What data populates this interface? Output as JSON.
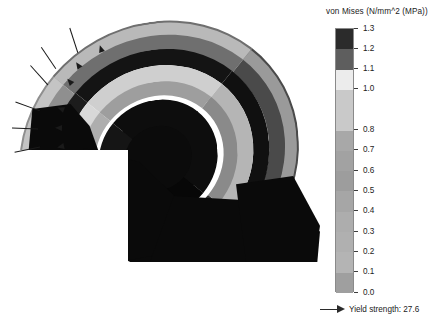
{
  "legend": {
    "title": "von Mises (N/mm^2 (MPa))",
    "units": "N/mm^2 (MPa)",
    "quantity": "von Mises",
    "yield_marker": {
      "label": "Yield strength: 27.6",
      "value": 27.6,
      "icon": "arrow-right-icon"
    }
  },
  "chart_data": {
    "type": "heatmap",
    "title": "von Mises (N/mm^2 (MPa))",
    "colorbar_orientation": "vertical",
    "colormap": "grayscale-banded",
    "legend_position": "right",
    "grid": false,
    "xlabel": "",
    "ylabel": "von Mises (N/mm^2 (MPa))",
    "ylim": [
      0.0,
      1.3
    ],
    "tick_labels": [
      "1.3",
      "1.2",
      "1.1",
      "1.0",
      "0.8",
      "0.7",
      "0.6",
      "0.5",
      "0.4",
      "0.3",
      "0.2",
      "0.1",
      "0.0"
    ],
    "tick_values": [
      1.3,
      1.2,
      1.1,
      1.0,
      0.8,
      0.7,
      0.6,
      0.5,
      0.4,
      0.3,
      0.2,
      0.1,
      0.0
    ],
    "bands": [
      {
        "from": 1.2,
        "to": 1.3,
        "color": "#2b2b2b"
      },
      {
        "from": 1.1,
        "to": 1.2,
        "color": "#5e5e5e"
      },
      {
        "from": 1.0,
        "to": 1.1,
        "color": "#ececec"
      },
      {
        "from": 0.8,
        "to": 1.0,
        "color": "#c9c9c9"
      },
      {
        "from": 0.7,
        "to": 0.8,
        "color": "#a8a8a8"
      },
      {
        "from": 0.6,
        "to": 0.7,
        "color": "#a2a2a2"
      },
      {
        "from": 0.5,
        "to": 0.6,
        "color": "#9d9d9d"
      },
      {
        "from": 0.4,
        "to": 0.5,
        "color": "#a6a6a6"
      },
      {
        "from": 0.3,
        "to": 0.4,
        "color": "#adadad"
      },
      {
        "from": 0.2,
        "to": 0.3,
        "color": "#b0b0b0"
      },
      {
        "from": 0.1,
        "to": 0.2,
        "color": "#b4b4b4"
      },
      {
        "from": 0.0,
        "to": 0.1,
        "color": "#9f9f9f"
      }
    ],
    "annotations": [
      {
        "text": "Yield strength: 27.6",
        "type": "arrow-marker",
        "value": 27.6
      }
    ]
  },
  "model": {
    "name": "sectioned-toroidal-shell-assembly",
    "view": "isometric-cut-half",
    "load_arrows_count": 6
  }
}
